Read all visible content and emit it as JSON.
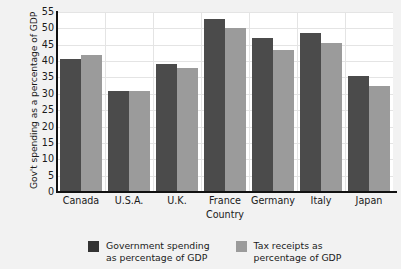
{
  "chart_data": {
    "type": "bar",
    "title": "",
    "xlabel": "Country",
    "ylabel": "Gov't spending as a percentage of GDP",
    "categories": [
      "Canada",
      "U.S.A.",
      "U.K.",
      "France",
      "Germany",
      "Italy",
      "Japan"
    ],
    "series": [
      {
        "name": "Government spending\nas percentage of GDP",
        "color": "#4b4b4b",
        "values": [
          40.5,
          31.0,
          39.0,
          53.0,
          47.0,
          48.7,
          35.5
        ]
      },
      {
        "name": "Tax receipts as\npercentage of GDP",
        "color": "#9b9b9b",
        "values": [
          41.8,
          31.0,
          38.0,
          50.2,
          43.5,
          45.5,
          32.5
        ]
      }
    ],
    "ylim": [
      0,
      55
    ],
    "yticks": [
      0,
      5,
      10,
      15,
      20,
      25,
      30,
      35,
      40,
      45,
      50,
      55
    ],
    "ytick_labels": [
      "0",
      "5",
      "10",
      "15",
      "20",
      "25",
      "30",
      "35",
      "40",
      "45",
      "50",
      "55"
    ],
    "grid": true,
    "legend_position": "bottom"
  },
  "legend": {
    "items": [
      {
        "label": "Government spending\nas percentage of GDP",
        "color": "#4b4b4b"
      },
      {
        "label": "Tax receipts as\npercentage of GDP",
        "color": "#9b9b9b"
      }
    ]
  }
}
